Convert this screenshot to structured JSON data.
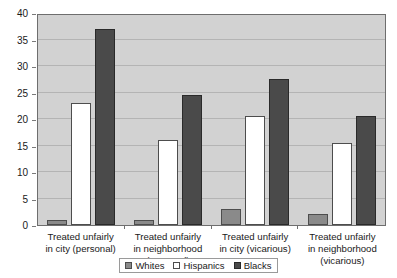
{
  "chart_data": {
    "type": "bar",
    "title": "",
    "subtitle": "",
    "xlabel": "",
    "ylabel": "",
    "ylim": [
      0,
      40
    ],
    "ytick_step": 5,
    "yticks": [
      0,
      5,
      10,
      15,
      20,
      25,
      30,
      35,
      40
    ],
    "ytick_labels": [
      "0",
      "5",
      "10",
      "15",
      "20",
      "25",
      "30",
      "35",
      "40"
    ],
    "grid": true,
    "grid_axis": "y",
    "legend_position": "bottom-center",
    "categories": [
      "Treated unfairly in city (personal)",
      "Treated unfairly in neighborhood (personal)",
      "Treated unfairly in city (vicarious)",
      "Treated unfairly in neighborhood (vicarious)"
    ],
    "category_lines": [
      [
        "Treated unfairly",
        "in city (personal)"
      ],
      [
        "Treated unfairly",
        "in neighborhood",
        "(personal)"
      ],
      [
        "Treated unfairly",
        "in city (vicarious)"
      ],
      [
        "Treated unfairly",
        "in neighborhood",
        "(vicarious)"
      ]
    ],
    "series": [
      {
        "name": "Whites",
        "color": "#8a8a8a",
        "values": [
          1,
          1,
          3,
          2
        ]
      },
      {
        "name": "Hispanics",
        "color": "#ffffff",
        "values": [
          23,
          16,
          20.5,
          15.5
        ]
      },
      {
        "name": "Blacks",
        "color": "#4a4a4a",
        "values": [
          37,
          24.5,
          27.5,
          20.5
        ]
      }
    ]
  },
  "legend": {
    "items": [
      {
        "label": "Whites"
      },
      {
        "label": "Hispanics"
      },
      {
        "label": "Blacks"
      }
    ]
  },
  "colors": {
    "plot_background": "#d2d2d2",
    "gridline": "#b4b4b4",
    "axis": "#6e6e6e",
    "text": "#1a1a1a",
    "page_background": "#ffffff"
  }
}
